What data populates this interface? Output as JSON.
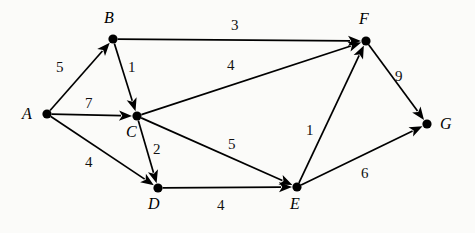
{
  "figure": {
    "width": 475,
    "height": 233,
    "background_color": "#fbfbf9",
    "ink_color": "#000000"
  },
  "graph": {
    "type": "directed-weighted-graph",
    "node_count": 7,
    "edge_count": 11,
    "nodes": [
      {
        "id": "A",
        "label": "A",
        "x": 47,
        "y": 114,
        "label_x": 22,
        "label_y": 106
      },
      {
        "id": "B",
        "label": "B",
        "x": 113,
        "y": 39,
        "label_x": 104,
        "label_y": 10
      },
      {
        "id": "C",
        "label": "C",
        "x": 137,
        "y": 116,
        "label_x": 126,
        "label_y": 124
      },
      {
        "id": "D",
        "label": "D",
        "x": 158,
        "y": 188,
        "label_x": 148,
        "label_y": 196
      },
      {
        "id": "E",
        "label": "E",
        "x": 297,
        "y": 187,
        "label_x": 290,
        "label_y": 196
      },
      {
        "id": "F",
        "label": "F",
        "x": 366,
        "y": 41,
        "label_x": 359,
        "label_y": 11
      },
      {
        "id": "G",
        "label": "G",
        "x": 427,
        "y": 124,
        "label_x": 440,
        "label_y": 116
      }
    ],
    "edges": [
      {
        "from": "A",
        "to": "B",
        "weight": 5,
        "label_x": 56,
        "label_y": 60
      },
      {
        "from": "A",
        "to": "C",
        "weight": 7,
        "label_x": 85,
        "label_y": 96
      },
      {
        "from": "A",
        "to": "D",
        "weight": 4,
        "label_x": 85,
        "label_y": 155
      },
      {
        "from": "B",
        "to": "C",
        "weight": 1,
        "label_x": 128,
        "label_y": 60
      },
      {
        "from": "B",
        "to": "F",
        "weight": 3,
        "label_x": 231,
        "label_y": 18
      },
      {
        "from": "C",
        "to": "F",
        "weight": 4,
        "label_x": 227,
        "label_y": 58
      },
      {
        "from": "C",
        "to": "D",
        "weight": 2,
        "label_x": 153,
        "label_y": 142
      },
      {
        "from": "C",
        "to": "E",
        "weight": 5,
        "label_x": 228,
        "label_y": 137
      },
      {
        "from": "D",
        "to": "E",
        "weight": 4,
        "label_x": 217,
        "label_y": 198
      },
      {
        "from": "E",
        "to": "F",
        "weight": 1,
        "label_x": 306,
        "label_y": 123
      },
      {
        "from": "E",
        "to": "G",
        "weight": 6,
        "label_x": 361,
        "label_y": 166
      },
      {
        "from": "F",
        "to": "G",
        "weight": 9,
        "label_x": 395,
        "label_y": 69
      }
    ]
  }
}
